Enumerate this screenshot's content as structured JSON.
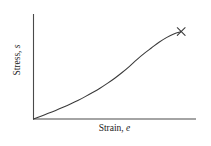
{
  "figure": {
    "background_color": "#ffffff",
    "width": 211,
    "height": 146,
    "line_color": "#3a3a3a",
    "axis_color": "#4a4a4a",
    "text_color": "#1b1b1b"
  },
  "axes": {
    "y_label_text": "Stress,",
    "y_label_symbol": "s",
    "x_label_text": "Strain,",
    "x_label_symbol": "e",
    "origin_label": ""
  },
  "marker": {
    "symbol": "×",
    "name": "failure-point"
  },
  "chart_data": {
    "type": "line",
    "title": "",
    "subtitle": "",
    "xlabel": "Strain, e",
    "ylabel": "Stress, s",
    "xlim": [
      0,
      1
    ],
    "ylim": [
      0,
      1
    ],
    "grid": false,
    "legend": null,
    "ticks": {
      "x": [],
      "y": []
    },
    "series": [
      {
        "name": "stress-strain",
        "x": [
          0.0,
          0.05,
          0.1,
          0.15,
          0.2,
          0.25,
          0.3,
          0.35,
          0.4,
          0.45,
          0.5,
          0.55,
          0.6,
          0.65,
          0.7,
          0.75,
          0.8,
          0.85,
          0.9,
          0.95,
          1.0
        ],
        "y": [
          0.0,
          0.03,
          0.061,
          0.093,
          0.127,
          0.163,
          0.201,
          0.242,
          0.286,
          0.333,
          0.385,
          0.441,
          0.503,
          0.57,
          0.643,
          0.71,
          0.77,
          0.83,
          0.88,
          0.92,
          0.945
        ]
      }
    ],
    "annotations": [
      {
        "text": "×",
        "x": 1.0,
        "y": 0.945,
        "name": "failure-marker"
      }
    ]
  }
}
